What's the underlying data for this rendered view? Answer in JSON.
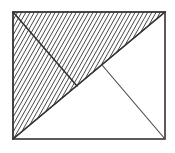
{
  "diagram": {
    "shapes": [
      {
        "name": "outer-rectangle",
        "kind": "rectangle"
      },
      {
        "name": "main-diagonal",
        "kind": "segment",
        "from": "bottom-left corner",
        "to": "top-right corner"
      },
      {
        "name": "perpendicular-from-top-left",
        "kind": "segment",
        "from": "top-left corner",
        "to": "point on diagonal"
      },
      {
        "name": "perpendicular-from-bottom-right",
        "kind": "segment",
        "from": "point on diagonal",
        "to": "bottom-right corner"
      },
      {
        "name": "hatched-triangle",
        "kind": "region",
        "fill": "diagonal hatching",
        "vertices": [
          "top-left",
          "top-right",
          "bottom-left"
        ]
      }
    ],
    "colors": {
      "line": "#333333",
      "background": "#ffffff"
    }
  }
}
